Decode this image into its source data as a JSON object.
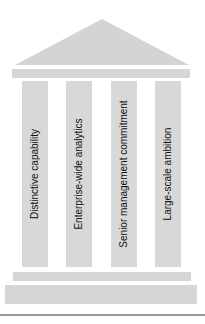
{
  "diagram": {
    "type": "pillars-temple",
    "colors": {
      "roof": "#d4d4d4",
      "pillar": "#d8d8d8",
      "bar": "#d6d6d6",
      "text": "#111111",
      "rule": "#9a9a9a"
    },
    "pillars": [
      {
        "label": "Distinctive capability"
      },
      {
        "label": "Enterprise-wide analytics"
      },
      {
        "label": "Senior management commitment"
      },
      {
        "label": "Large-scale ambition"
      }
    ]
  }
}
